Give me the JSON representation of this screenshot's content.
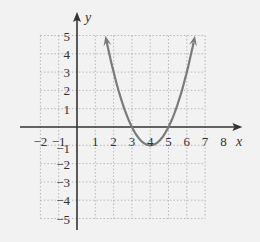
{
  "chart_data": {
    "type": "line",
    "title": "",
    "xlabel": "x",
    "ylabel": "y",
    "function": "y = (x - 4)^2 - 1",
    "vertex": [
      4,
      -1
    ],
    "x_intercepts": [
      3,
      5
    ],
    "xlim": [
      -2,
      8
    ],
    "ylim": [
      -5,
      5
    ],
    "grid": true,
    "x_ticks": [
      "-2",
      "-1",
      "1",
      "2",
      "3",
      "4",
      "5",
      "6",
      "7",
      "8"
    ],
    "y_ticks": [
      "5",
      "4",
      "3",
      "2",
      "1",
      "-1",
      "-2",
      "-3",
      "-4",
      "-5"
    ],
    "series": [
      {
        "name": "parabola",
        "color": "#7a7a7a",
        "x": [
          1.6,
          2,
          2.5,
          3,
          3.5,
          4,
          4.5,
          5,
          5.5,
          6,
          6.4
        ],
        "y": [
          4.76,
          3,
          1.25,
          0,
          -0.75,
          -1,
          -0.75,
          0,
          1.25,
          3,
          4.76
        ],
        "arrows_both_ends": true
      }
    ]
  },
  "colors": {
    "background": "#f2f2f2",
    "axis": "#333333",
    "grid": "#aaaaaa",
    "curve": "#7a7a7a"
  }
}
